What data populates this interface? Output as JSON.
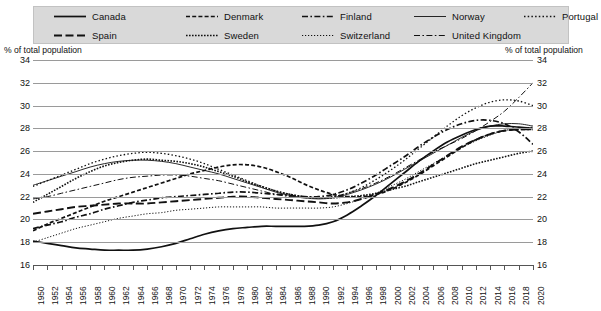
{
  "axis_titles": {
    "left": "% of total population",
    "right": "% of total population"
  },
  "legend": {
    "rows": [
      [
        {
          "label": "Canada",
          "style": "solid",
          "icon": "legend-line-solid"
        },
        {
          "label": "Denmark",
          "style": "dashed-short",
          "icon": "legend-line-dashed-short"
        },
        {
          "label": "Finland",
          "style": "dash-dot",
          "icon": "legend-line-dash-dot"
        },
        {
          "label": "Norway",
          "style": "solid-thin",
          "icon": "legend-line-solid-thin"
        },
        {
          "label": "Portugal",
          "style": "dotted-wide",
          "icon": "legend-line-dotted-wide"
        }
      ],
      [
        {
          "label": "Spain",
          "style": "dashed-long",
          "icon": "legend-line-dashed-long"
        },
        {
          "label": "Sweden",
          "style": "dotted-dense",
          "icon": "legend-line-dotted-dense"
        },
        {
          "label": "Switzerland",
          "style": "dotted-fine",
          "icon": "legend-line-dotted-fine"
        },
        {
          "label": "United Kingdom",
          "style": "dash-dot-thin",
          "icon": "legend-line-dash-dot-thin"
        }
      ]
    ]
  },
  "chart_data": {
    "type": "line",
    "title": "",
    "xlabel": "",
    "ylabel": "% of total population",
    "ylim": [
      16,
      34
    ],
    "ytick_step": 2,
    "yticks": [
      16,
      18,
      20,
      22,
      24,
      26,
      28,
      30,
      32,
      34
    ],
    "xlim": [
      1950,
      2020
    ],
    "xtick_step": 2,
    "grid": true,
    "legend_position": "top",
    "x": [
      1950,
      1952,
      1954,
      1956,
      1958,
      1960,
      1962,
      1964,
      1966,
      1968,
      1970,
      1972,
      1974,
      1976,
      1978,
      1980,
      1982,
      1984,
      1986,
      1988,
      1990,
      1992,
      1994,
      1996,
      1998,
      2000,
      2002,
      2004,
      2006,
      2008,
      2010,
      2012,
      2014,
      2016,
      2018,
      2020
    ],
    "series": [
      {
        "name": "Canada",
        "style": "solid",
        "values": [
          18.1,
          17.9,
          17.7,
          17.5,
          17.4,
          17.3,
          17.3,
          17.3,
          17.4,
          17.6,
          17.9,
          18.3,
          18.7,
          19.0,
          19.2,
          19.3,
          19.4,
          19.4,
          19.4,
          19.4,
          19.5,
          19.8,
          20.4,
          21.2,
          22.1,
          23.1,
          24.1,
          25.1,
          26.0,
          26.8,
          27.4,
          27.9,
          28.2,
          28.2,
          28.1,
          28.0
        ]
      },
      {
        "name": "Denmark",
        "style": "dashed-short",
        "values": [
          19.0,
          19.6,
          20.1,
          20.6,
          21.1,
          21.6,
          22.0,
          22.4,
          22.8,
          23.2,
          23.6,
          24.0,
          24.3,
          24.6,
          24.8,
          24.8,
          24.6,
          24.2,
          23.7,
          23.1,
          22.6,
          22.2,
          22.0,
          22.0,
          22.2,
          22.6,
          23.2,
          23.9,
          24.7,
          25.5,
          26.3,
          27.0,
          27.5,
          27.8,
          27.9,
          27.9
        ]
      },
      {
        "name": "Finland",
        "style": "dash-dot",
        "values": [
          19.2,
          19.5,
          19.8,
          20.2,
          20.5,
          20.9,
          21.2,
          21.5,
          21.7,
          21.9,
          22.0,
          22.1,
          22.2,
          22.3,
          22.4,
          22.4,
          22.3,
          22.2,
          22.1,
          22.0,
          22.0,
          22.2,
          22.6,
          23.2,
          23.9,
          24.7,
          25.5,
          26.4,
          27.2,
          27.9,
          28.4,
          28.7,
          28.7,
          28.4,
          27.7,
          26.6
        ]
      },
      {
        "name": "Norway",
        "style": "solid-thin",
        "values": [
          23.0,
          23.4,
          23.8,
          24.2,
          24.6,
          24.9,
          25.1,
          25.2,
          25.2,
          25.1,
          24.9,
          24.6,
          24.3,
          24.0,
          23.6,
          23.2,
          22.8,
          22.4,
          22.1,
          21.9,
          21.8,
          21.9,
          22.2,
          22.6,
          23.1,
          23.7,
          24.4,
          25.1,
          25.8,
          26.5,
          27.2,
          27.8,
          28.2,
          28.4,
          28.4,
          28.2
        ]
      },
      {
        "name": "Portugal",
        "style": "dotted-wide",
        "values": [
          22.9,
          23.4,
          23.9,
          24.4,
          24.9,
          25.3,
          25.6,
          25.8,
          25.9,
          25.8,
          25.6,
          25.3,
          24.9,
          24.4,
          23.9,
          23.4,
          22.9,
          22.5,
          22.2,
          22.0,
          21.9,
          22.0,
          22.3,
          22.8,
          23.5,
          24.3,
          25.2,
          26.2,
          27.2,
          28.2,
          29.1,
          29.8,
          30.3,
          30.5,
          30.4,
          30.0
        ]
      },
      {
        "name": "Spain",
        "style": "dashed-long",
        "values": [
          20.5,
          20.7,
          20.9,
          21.1,
          21.2,
          21.3,
          21.4,
          21.4,
          21.4,
          21.5,
          21.6,
          21.7,
          21.8,
          21.9,
          22.0,
          22.0,
          21.9,
          21.8,
          21.7,
          21.6,
          21.5,
          21.4,
          21.5,
          21.8,
          22.2,
          22.7,
          23.3,
          24.0,
          24.8,
          25.6,
          26.4,
          27.0,
          27.5,
          27.8,
          27.9,
          27.9
        ]
      },
      {
        "name": "Sweden",
        "style": "dotted-dense",
        "values": [
          21.5,
          22.2,
          22.9,
          23.6,
          24.2,
          24.7,
          25.0,
          25.2,
          25.3,
          25.2,
          25.1,
          24.9,
          24.6,
          24.2,
          23.8,
          23.3,
          22.9,
          22.5,
          22.2,
          22.0,
          21.9,
          21.9,
          22.0,
          22.1,
          22.3,
          22.6,
          22.9,
          23.3,
          23.7,
          24.1,
          24.5,
          24.9,
          25.2,
          25.5,
          25.8,
          26.0
        ]
      },
      {
        "name": "Switzerland",
        "style": "dotted-fine",
        "values": [
          18.0,
          18.4,
          18.8,
          19.2,
          19.5,
          19.8,
          20.1,
          20.3,
          20.5,
          20.6,
          20.8,
          20.9,
          21.0,
          21.1,
          21.1,
          21.1,
          21.1,
          21.0,
          21.0,
          21.0,
          21.0,
          21.1,
          21.4,
          21.8,
          22.3,
          22.9,
          23.5,
          24.2,
          24.9,
          25.6,
          26.3,
          26.9,
          27.4,
          27.8,
          28.0,
          28.1
        ]
      },
      {
        "name": "United Kingdom",
        "style": "dash-dot-thin",
        "values": [
          21.8,
          22.0,
          22.3,
          22.6,
          22.9,
          23.2,
          23.5,
          23.7,
          23.8,
          23.9,
          23.9,
          23.8,
          23.6,
          23.4,
          23.1,
          22.8,
          22.5,
          22.2,
          22.0,
          21.9,
          21.9,
          22.0,
          22.3,
          22.7,
          23.2,
          23.8,
          24.5,
          25.2,
          25.9,
          26.5,
          27.1,
          27.8,
          28.6,
          29.5,
          30.7,
          32.0
        ]
      }
    ]
  }
}
